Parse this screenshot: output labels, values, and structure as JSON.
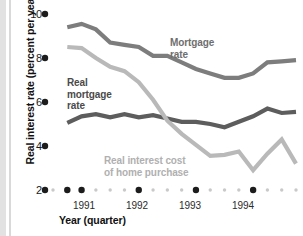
{
  "chart_data": {
    "type": "line",
    "title": "",
    "xlabel": "Year (quarter)",
    "ylabel": "Real interest rate (percent per year)",
    "ylim": [
      2,
      10
    ],
    "yticks": [
      10,
      8,
      6,
      4,
      2
    ],
    "ytick_labels": [
      "10",
      "8",
      "6",
      "4",
      "2"
    ],
    "xlim": [
      1990.5,
      1994.75
    ],
    "xtick_labels": [
      "1991",
      "1992",
      "1993",
      "1994"
    ],
    "xtick_values": [
      1991.375,
      1992.375,
      1993.375,
      1994.375
    ],
    "major_tick_values": [
      1990.75,
      1991.0,
      1992.0,
      1993.0,
      1994.0
    ],
    "minor_tick_values": [
      1990.5,
      1991.25,
      1991.5,
      1991.75,
      1992.25,
      1992.5,
      1992.75,
      1993.25,
      1993.5,
      1993.75,
      1994.25,
      1994.5,
      1994.75
    ],
    "grid": false,
    "legend_position": "inline-annotations",
    "series": [
      {
        "name": "Mortgage rate",
        "color": "#7d7d7d",
        "label_text_line1": "Mortgage",
        "label_text_line2": "rate",
        "x": [
          1990.75,
          1991.0,
          1991.25,
          1991.5,
          1991.75,
          1992.0,
          1992.25,
          1992.5,
          1992.75,
          1993.0,
          1993.25,
          1993.5,
          1993.75,
          1994.0,
          1994.25,
          1994.5,
          1994.75
        ],
        "values": [
          9.4,
          9.55,
          9.3,
          8.7,
          8.6,
          8.5,
          8.1,
          8.1,
          7.8,
          7.5,
          7.3,
          7.1,
          7.1,
          7.3,
          7.8,
          7.85,
          7.9
        ]
      },
      {
        "name": "Real mortgage rate",
        "color": "#5d5d5d",
        "label_text_line1": "Real",
        "label_text_line2": "mortgage",
        "label_text_line3": "rate",
        "x": [
          1990.75,
          1991.0,
          1991.25,
          1991.5,
          1991.75,
          1992.0,
          1992.25,
          1992.5,
          1992.75,
          1993.0,
          1993.25,
          1993.5,
          1993.75,
          1994.0,
          1994.25,
          1994.5,
          1994.75
        ],
        "values": [
          5.05,
          5.35,
          5.45,
          5.3,
          5.45,
          5.3,
          5.4,
          5.25,
          5.1,
          5.1,
          5.0,
          4.85,
          5.1,
          5.35,
          5.7,
          5.5,
          5.55
        ]
      },
      {
        "name": "Real interest cost of home purchase",
        "color": "#b9b9b9",
        "label_text_line1": "Real interest cost",
        "label_text_line2": "of home purchase",
        "x": [
          1990.75,
          1991.0,
          1991.25,
          1991.5,
          1991.75,
          1992.0,
          1992.25,
          1992.5,
          1992.75,
          1993.0,
          1993.25,
          1993.5,
          1993.75,
          1994.0,
          1994.25,
          1994.5,
          1994.75
        ],
        "values": [
          8.5,
          8.45,
          8.0,
          7.6,
          7.4,
          6.9,
          6.1,
          5.15,
          4.55,
          4.05,
          3.55,
          3.6,
          3.75,
          2.9,
          3.65,
          4.3,
          3.2
        ]
      }
    ]
  },
  "axis": {
    "ytick_10": "10",
    "ytick_8": "8",
    "ytick_6": "6",
    "ytick_4": "4",
    "ytick_2": "2",
    "xtick_1991": "1991",
    "xtick_1992": "1992",
    "xtick_1993": "1993",
    "xtick_1994": "1994",
    "xlabel": "Year (quarter)",
    "ylabel": "Real interest rate (percent per year)"
  },
  "annotations": {
    "mortgage_line1": "Mortgage",
    "mortgage_line2": "rate",
    "realmort_line1": "Real",
    "realmort_line2": "mortgage",
    "realmort_line3": "rate",
    "realcost_line1": "Real interest cost",
    "realcost_line2": "of home purchase"
  },
  "colors": {
    "mortgage_rate": "#7d7d7d",
    "real_mortgage_rate": "#5d5d5d",
    "real_interest_cost": "#b9b9b9",
    "tick_major": "#1c1c1c",
    "tick_minor": "#c9c9c9",
    "background": "#ffffff"
  }
}
